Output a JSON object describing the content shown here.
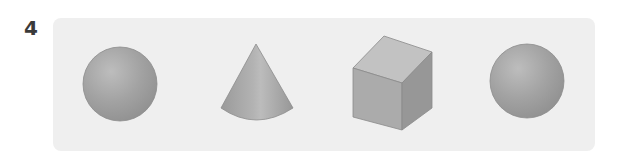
{
  "question": {
    "number": "4"
  },
  "panel": {
    "background": "#efefef"
  },
  "shapes": [
    {
      "type": "sphere",
      "label": "sphere"
    },
    {
      "type": "cone",
      "label": "cone"
    },
    {
      "type": "cube",
      "label": "cube"
    },
    {
      "type": "sphere",
      "label": "sphere"
    }
  ],
  "colors": {
    "shape_fill": "#a3a3a3",
    "shape_light": "#c4c4c4",
    "shape_dark": "#8e8e8e",
    "outline": "#8a8a8a"
  }
}
